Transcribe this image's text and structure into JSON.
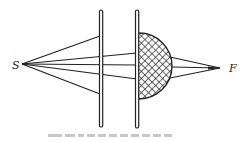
{
  "diagram": {
    "type": "optics-ray-diagram",
    "labels": {
      "source": "S",
      "focus": "F"
    },
    "elements": [
      {
        "id": "plate-1",
        "kind": "plate",
        "x": 101,
        "y1": 11,
        "y2": 126
      },
      {
        "id": "plate-2",
        "kind": "plate",
        "x": 137,
        "y1": 11,
        "y2": 127
      },
      {
        "id": "hatched-lens",
        "kind": "half-disc",
        "cx": 139,
        "cy": 66,
        "r": 33,
        "fill": "crosshatch"
      }
    ],
    "points": {
      "S": [
        22,
        64
      ],
      "F": [
        220,
        68
      ]
    },
    "rays": [
      {
        "from": "S",
        "to": [
          100,
          36
        ]
      },
      {
        "from": "S",
        "to": [
          100,
          94
        ]
      },
      {
        "from": "S",
        "to": [
          136,
          53
        ]
      },
      {
        "from": "S",
        "to": [
          136,
          65
        ]
      },
      {
        "from": "S",
        "to": [
          136,
          79
        ]
      },
      {
        "from": [
          170,
          57
        ],
        "to": "F"
      },
      {
        "from": [
          172,
          68
        ],
        "to": "F"
      },
      {
        "from": [
          170,
          77
        ],
        "to": "F"
      }
    ],
    "colors": {
      "ink": "#222222",
      "background": "#ffffff"
    }
  }
}
